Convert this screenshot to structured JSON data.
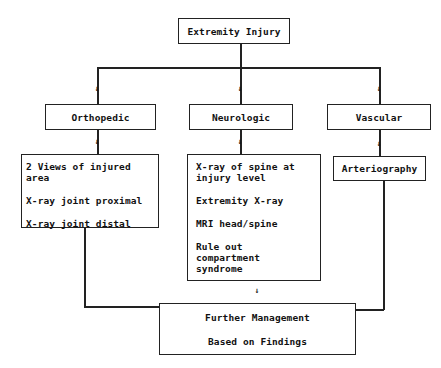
{
  "root": {
    "label": "Extremity Injury"
  },
  "categories": [
    {
      "label": "Orthopedic",
      "items": [
        "2 Views of injured area",
        "X-ray joint proximal",
        "X-ray joint distal"
      ]
    },
    {
      "label": "Neurologic",
      "items": [
        "X-ray of spine at injury level",
        "Extremity X-ray",
        "MRI head/spine",
        "Rule out compartment syndrome"
      ]
    },
    {
      "label": "Vascular",
      "items": [
        "Arteriography"
      ]
    }
  ],
  "outcome": {
    "line1": "Further Management",
    "line2": "Based on Findings"
  },
  "arrow_glyph": "↓"
}
